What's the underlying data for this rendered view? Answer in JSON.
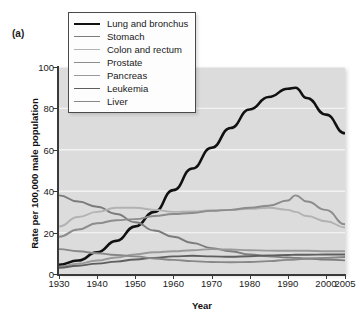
{
  "figure": {
    "panel_label": "(a)",
    "xlabel": "Year",
    "ylabel": "Rate per 100,000 male population"
  },
  "chart_data": {
    "type": "line",
    "title": "",
    "subtitle": "",
    "panel_label": "(a)",
    "xlabel": "Year",
    "ylabel": "Rate per 100,000 male population",
    "xlim": [
      1930,
      2005
    ],
    "ylim": [
      0,
      100
    ],
    "xticks": [
      1930,
      1940,
      1950,
      1960,
      1970,
      1980,
      1990,
      2000,
      2005
    ],
    "xticklabels": [
      "1930",
      "1940",
      "1950",
      "1960",
      "1970",
      "1980",
      "1990",
      "2000",
      "2005"
    ],
    "yticks": [
      0,
      20,
      40,
      60,
      80,
      100
    ],
    "yticklabels": [
      "0",
      "20",
      "40",
      "60",
      "80",
      "100"
    ],
    "grid": "horizontal-white",
    "plot_background": "#dcdcdc",
    "legend_position": "top-left",
    "x": [
      1930,
      1935,
      1940,
      1945,
      1950,
      1955,
      1960,
      1965,
      1970,
      1975,
      1980,
      1985,
      1990,
      1992,
      1995,
      2000,
      2005
    ],
    "series": [
      {
        "name": "Lung and bronchus",
        "color": "#111111",
        "width": 2.6,
        "values": [
          4.5,
          6.5,
          10.5,
          16.0,
          23.0,
          30.0,
          40.5,
          51.0,
          61.0,
          70.5,
          79.5,
          85.5,
          89.5,
          90.0,
          85.0,
          77.0,
          68.0
        ]
      },
      {
        "name": "Stomach",
        "color": "#7c7c7c",
        "width": 1.9,
        "values": [
          38.0,
          35.0,
          32.5,
          29.0,
          25.0,
          21.0,
          18.0,
          15.0,
          12.5,
          11.0,
          9.5,
          8.5,
          8.0,
          7.8,
          7.5,
          7.0,
          6.6
        ]
      },
      {
        "name": "Colon and rectum",
        "color": "#b2b2b2",
        "width": 1.9,
        "values": [
          23.0,
          27.5,
          30.0,
          32.0,
          32.0,
          31.0,
          30.0,
          30.2,
          30.8,
          31.0,
          31.5,
          32.0,
          31.0,
          30.0,
          28.0,
          25.5,
          22.5
        ]
      },
      {
        "name": "Prostate",
        "color": "#8c8c8c",
        "width": 1.9,
        "values": [
          18.0,
          21.5,
          24.5,
          26.0,
          26.5,
          28.0,
          29.0,
          29.5,
          30.5,
          31.0,
          32.0,
          33.0,
          35.5,
          38.0,
          35.0,
          31.0,
          24.0
        ]
      },
      {
        "name": "Pancreas",
        "color": "#9a9a9a",
        "width": 1.9,
        "values": [
          3.5,
          5.0,
          6.5,
          8.0,
          9.5,
          10.5,
          11.0,
          11.5,
          12.0,
          11.8,
          11.5,
          11.3,
          11.2,
          11.2,
          11.2,
          11.0,
          11.0
        ]
      },
      {
        "name": "Leukemia",
        "color": "#5e5e5e",
        "width": 1.9,
        "values": [
          3.0,
          4.0,
          5.0,
          6.0,
          7.0,
          7.8,
          8.5,
          8.8,
          8.5,
          8.3,
          8.6,
          9.0,
          9.2,
          9.3,
          9.3,
          9.4,
          9.4
        ]
      },
      {
        "name": "Liver",
        "color": "#888888",
        "width": 1.9,
        "values": [
          12.0,
          11.0,
          10.0,
          9.2,
          8.5,
          7.5,
          6.8,
          6.2,
          5.8,
          5.7,
          5.8,
          6.2,
          6.8,
          7.0,
          7.4,
          7.8,
          8.2
        ]
      }
    ]
  }
}
